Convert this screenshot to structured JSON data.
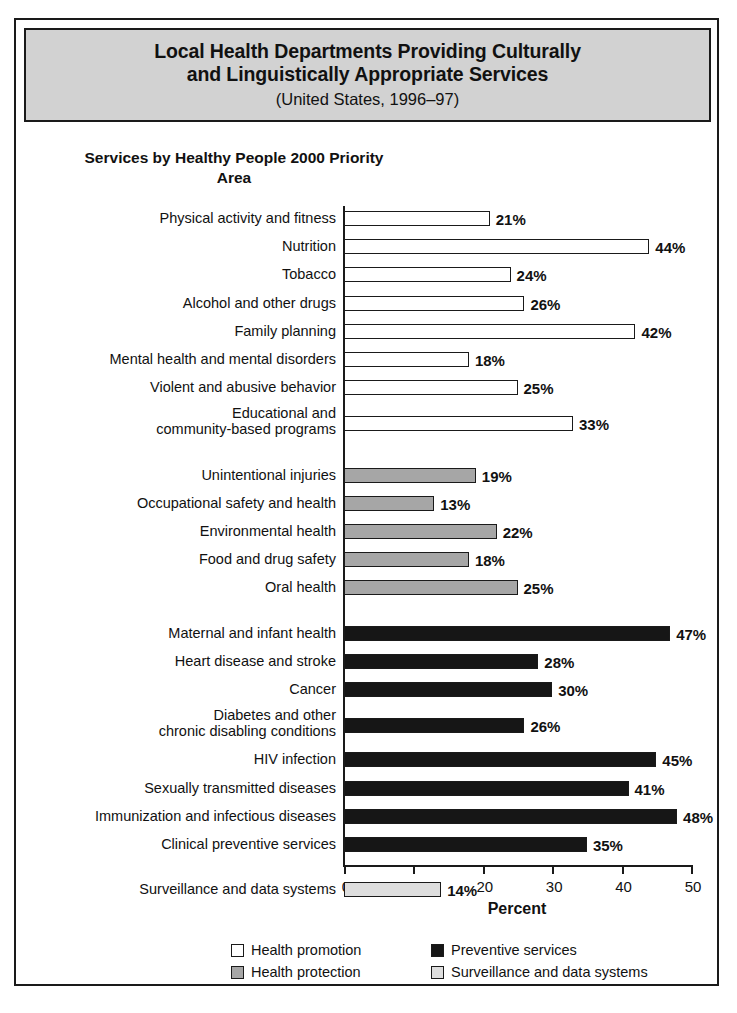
{
  "figure": {
    "title_lines": [
      "Local Health Departments Providing Culturally",
      "and Linguistically Appropriate Services"
    ],
    "subtitle": "(United States, 1996–97)",
    "plot_header": "Services by Healthy People\n2000 Priority Area"
  },
  "chart_data": {
    "type": "bar",
    "orientation": "horizontal",
    "title": "Local Health Departments Providing Culturally and Linguistically Appropriate Services",
    "subtitle": "(United States, 1996–97)",
    "xlabel": "Percent",
    "ylabel": "Services by Healthy People 2000 Priority Area",
    "xlim": [
      0,
      50
    ],
    "xticks": [
      0,
      10,
      20,
      30,
      40,
      50
    ],
    "xtick_labels": [
      "0",
      "10",
      "20",
      "30",
      "40",
      "50"
    ],
    "grid": false,
    "legend_position": "bottom",
    "value_suffix": "%",
    "groups": [
      {
        "name": "Health promotion",
        "color": "#ffffff",
        "categories": [
          "Physical activity and fitness",
          "Nutrition",
          "Tobacco",
          "Alcohol and other drugs",
          "Family planning",
          "Mental health and mental disorders",
          "Violent and abusive behavior",
          "Educational and\ncommunity-based programs"
        ],
        "values": [
          21,
          44,
          24,
          26,
          42,
          18,
          25,
          33
        ],
        "value_labels": [
          "21%",
          "44%",
          "24%",
          "26%",
          "42%",
          "18%",
          "25%",
          "33%"
        ]
      },
      {
        "name": "Health protection",
        "color": "#a6a6a6",
        "categories": [
          "Unintentional injuries",
          "Occupational safety and health",
          "Environmental health",
          "Food and drug safety",
          "Oral health"
        ],
        "values": [
          19,
          13,
          22,
          18,
          25
        ],
        "value_labels": [
          "19%",
          "13%",
          "22%",
          "18%",
          "25%"
        ]
      },
      {
        "name": "Preventive services",
        "color": "#161616",
        "categories": [
          "Maternal and infant health",
          "Heart disease and stroke",
          "Cancer",
          "Diabetes and other\nchronic disabling conditions",
          "HIV infection",
          "Sexually transmitted diseases",
          "Immunization and infectious diseases",
          "Clinical preventive services"
        ],
        "values": [
          47,
          28,
          30,
          26,
          45,
          41,
          48,
          35
        ],
        "value_labels": [
          "47%",
          "28%",
          "30%",
          "26%",
          "45%",
          "41%",
          "48%",
          "35%"
        ]
      },
      {
        "name": "Surveillance and data systems",
        "color": "#dedede",
        "categories": [
          "Surveillance and data systems"
        ],
        "values": [
          14
        ],
        "value_labels": [
          "14%"
        ]
      }
    ]
  },
  "legend": {
    "entries": [
      {
        "label": "Health promotion",
        "swatch": "promotion"
      },
      {
        "label": "Preventive services",
        "swatch": "preventive"
      },
      {
        "label": "Health protection",
        "swatch": "protection"
      },
      {
        "label": "Surveillance and data systems",
        "swatch": "surveillance"
      }
    ]
  }
}
